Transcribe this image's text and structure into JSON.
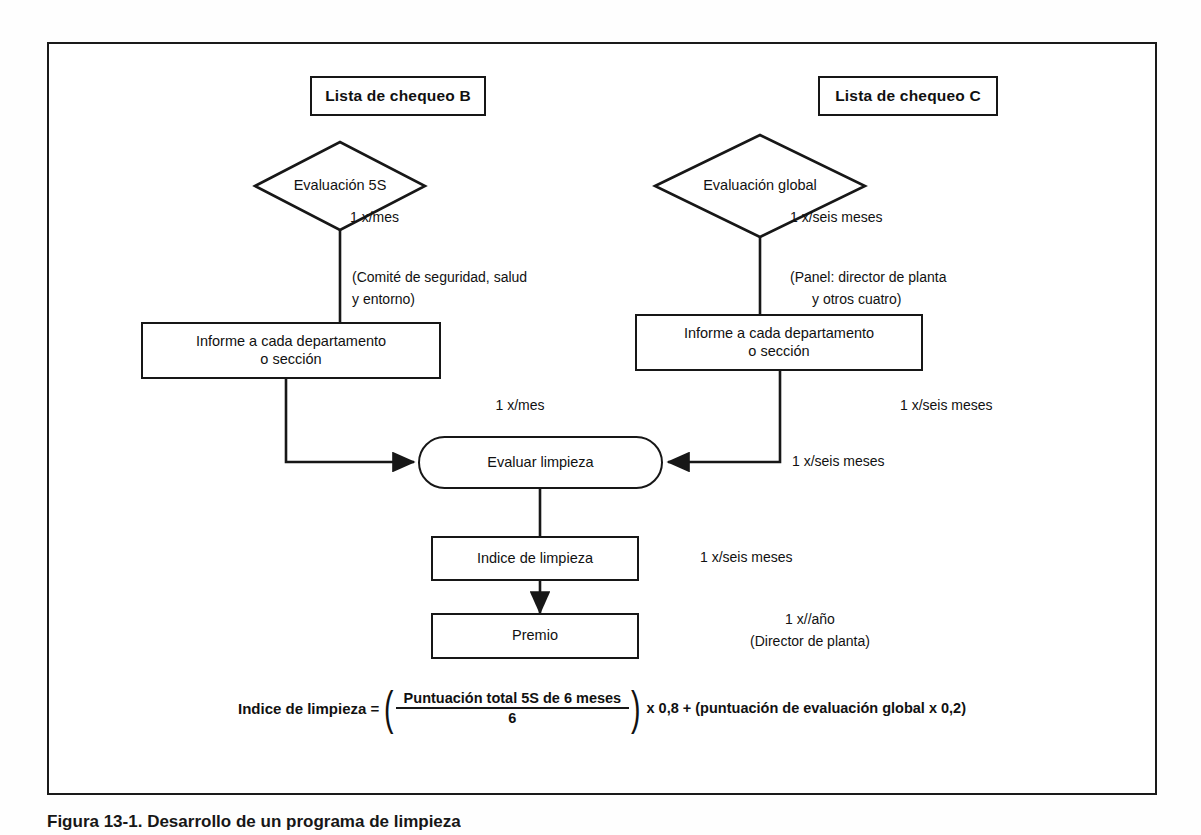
{
  "figure": {
    "caption": "Figura 13-1. Desarrollo de un programa de limpieza"
  },
  "nodes": {
    "checklist_b": {
      "label": "Lista de chequeo B"
    },
    "checklist_c": {
      "label": "Lista de chequeo C"
    },
    "eval_5s": {
      "label": "Evaluación 5S"
    },
    "eval_global": {
      "label": "Evaluación global"
    },
    "report_left_line1": "Informe a cada departamento",
    "report_left_line2": "o sección",
    "report_right_line1": "Informe a cada departamento",
    "report_right_line2": "o sección",
    "evaluar_limpieza": {
      "label": "Evaluar limpieza"
    },
    "indice_limpieza": {
      "label": "Indice de limpieza"
    },
    "premio": {
      "label": "Premio"
    }
  },
  "annotations": {
    "freq_5s": "1 x/mes",
    "owner_5s_line1": "(Comité de seguridad, salud",
    "owner_5s_line2": "y entorno)",
    "freq_global": "1 x/seis meses",
    "owner_global_line1": "(Panel: director de planta",
    "owner_global_line2": "y otros cuatro)",
    "freq_left_to_eval": "1 x/mes",
    "freq_right_report": "1 x/seis meses",
    "freq_right_to_eval": "1 x/seis meses",
    "freq_indice": "1 x/seis meses",
    "freq_premio": "1 x//año",
    "owner_premio": "(Director de planta)"
  },
  "formula": {
    "lhs": "Indice de limpieza =",
    "open_paren": "(",
    "numerator": "Puntuación total 5S de 6 meses",
    "denominator": "6",
    "close_paren": ")",
    "rhs": "x 0,8 + (puntuación de evaluación global x 0,2)"
  },
  "colors": {
    "ink": "#171717",
    "paper": "#ffffff"
  }
}
